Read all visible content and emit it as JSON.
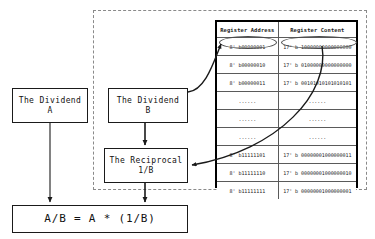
{
  "diagram": {
    "boxes": {
      "dividend_a": {
        "line1": "The Dividend",
        "line2": "A"
      },
      "dividend_b": {
        "line1": "The Dividend",
        "line2": "B"
      },
      "reciprocal": {
        "line1": "The Reciprocal",
        "line2": "1/B"
      },
      "result": {
        "text": "A/B = A * (1/B)"
      }
    }
  },
  "register_table": {
    "headers": [
      "Register Address",
      "Register Content"
    ],
    "rows": [
      {
        "address": "8' b00000001",
        "content": "17' b 10000000000000000"
      },
      {
        "address": "8' b00000010",
        "content": "17' b 01000000000000000"
      },
      {
        "address": "8' b00000011",
        "content": "17' b 00101010101010101"
      },
      {
        "address": "......",
        "content": "......"
      },
      {
        "address": "......",
        "content": "......"
      },
      {
        "address": "......",
        "content": "......"
      },
      {
        "address": "8' b11111101",
        "content": "17' b 00000001000000011"
      },
      {
        "address": "8' b11111110",
        "content": "17' b 00000001000000010"
      },
      {
        "address": "8' b11111111",
        "content": "17' b 00000001000000001"
      }
    ]
  },
  "colors": {
    "stroke": "#1a1a1a",
    "table_border": "#000000",
    "grid_line": "#5a5a5a",
    "dashed_region": "#8a8a8a",
    "highlight_ellipse": "#4a4a4a",
    "background": "#ffffff"
  }
}
